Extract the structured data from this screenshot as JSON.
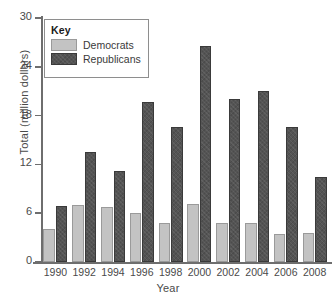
{
  "chart_data": {
    "type": "bar",
    "title": "",
    "xlabel": "Year",
    "ylabel": "Total (million dollars)",
    "categories": [
      "1990",
      "1992",
      "1994",
      "1996",
      "1998",
      "2000",
      "2002",
      "2004",
      "2006",
      "2008"
    ],
    "series": [
      {
        "name": "Democrats",
        "color": "#c3c3c3",
        "values": [
          4.0,
          7.0,
          6.8,
          6.0,
          4.8,
          7.1,
          4.8,
          4.8,
          3.5,
          3.6
        ]
      },
      {
        "name": "Republicans",
        "color": "#545454",
        "values": [
          6.9,
          13.5,
          11.2,
          19.7,
          16.6,
          26.6,
          20.0,
          21.0,
          16.6,
          10.5
        ]
      }
    ],
    "ylim": [
      0,
      30
    ],
    "yticks": [
      0,
      6,
      12,
      18,
      24,
      30
    ],
    "ytick_labels": [
      "0",
      "6",
      "12",
      "18",
      "24",
      "30"
    ],
    "grid": false,
    "legend_position": "top-left",
    "legend_title": "Key"
  },
  "legend": {
    "title": "Key",
    "entries": [
      {
        "label": "Democrats"
      },
      {
        "label": "Republicans"
      }
    ]
  },
  "axes": {
    "x_title": "Year",
    "y_title": "Total (million dollars)"
  }
}
